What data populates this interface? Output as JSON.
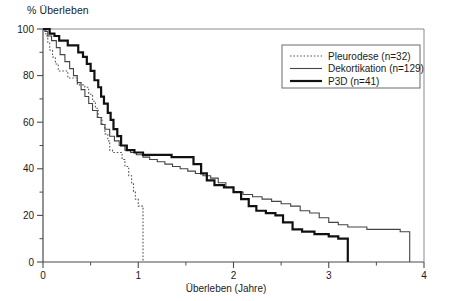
{
  "chart_data": {
    "type": "line",
    "subtype": "kaplan-meier-step",
    "title": "",
    "ylabel": "% Überleben",
    "xlabel": "Überleben (Jahre)",
    "xlim": [
      0,
      4
    ],
    "ylim": [
      0,
      100
    ],
    "xticks": [
      0,
      1,
      2,
      3,
      4
    ],
    "xticklabels": [
      "0",
      "1",
      "2",
      "3",
      "4"
    ],
    "xminorticks": [
      0.5,
      1.5,
      2.5,
      3.5
    ],
    "yticks": [
      0,
      20,
      40,
      60,
      80,
      100
    ],
    "yticklabels": [
      "0",
      "20",
      "40",
      "60",
      "80",
      "100"
    ],
    "yminorticks": [
      10,
      30,
      50,
      70,
      90
    ],
    "grid": false,
    "legend_position": "top-right",
    "series": [
      {
        "name": "Pleurodese (n=32)",
        "label": "Pleurodese (n=32)",
        "n": 32,
        "style": "dotted",
        "color": "#555555",
        "width": 1.1,
        "points": [
          [
            0.0,
            100
          ],
          [
            0.03,
            97
          ],
          [
            0.05,
            94
          ],
          [
            0.07,
            91
          ],
          [
            0.1,
            88
          ],
          [
            0.13,
            85
          ],
          [
            0.16,
            82
          ],
          [
            0.22,
            82
          ],
          [
            0.26,
            79
          ],
          [
            0.32,
            79
          ],
          [
            0.36,
            76
          ],
          [
            0.44,
            75
          ],
          [
            0.48,
            72
          ],
          [
            0.52,
            69
          ],
          [
            0.55,
            66
          ],
          [
            0.58,
            62
          ],
          [
            0.62,
            59
          ],
          [
            0.65,
            55
          ],
          [
            0.68,
            52
          ],
          [
            0.7,
            48
          ],
          [
            0.73,
            47
          ],
          [
            0.8,
            47
          ],
          [
            0.83,
            44
          ],
          [
            0.86,
            41
          ],
          [
            0.9,
            37
          ],
          [
            0.93,
            34
          ],
          [
            0.95,
            30
          ],
          [
            0.97,
            27
          ],
          [
            1.0,
            24
          ],
          [
            1.03,
            24
          ],
          [
            1.05,
            0
          ]
        ]
      },
      {
        "name": "Dekortikation (n=129)",
        "label": "Dekortikation (n=129)",
        "n": 129,
        "style": "solid",
        "color": "#444444",
        "width": 1.1,
        "points": [
          [
            0.0,
            100
          ],
          [
            0.02,
            99
          ],
          [
            0.05,
            97
          ],
          [
            0.09,
            95
          ],
          [
            0.14,
            92
          ],
          [
            0.18,
            89
          ],
          [
            0.23,
            86
          ],
          [
            0.28,
            83
          ],
          [
            0.32,
            80
          ],
          [
            0.36,
            77
          ],
          [
            0.4,
            74
          ],
          [
            0.44,
            71
          ],
          [
            0.48,
            68
          ],
          [
            0.52,
            65
          ],
          [
            0.57,
            62
          ],
          [
            0.61,
            59
          ],
          [
            0.65,
            57
          ],
          [
            0.7,
            54
          ],
          [
            0.75,
            52
          ],
          [
            0.8,
            50
          ],
          [
            0.86,
            48
          ],
          [
            0.92,
            47
          ],
          [
            0.98,
            46
          ],
          [
            1.05,
            45
          ],
          [
            1.12,
            44
          ],
          [
            1.2,
            43
          ],
          [
            1.28,
            42
          ],
          [
            1.36,
            41
          ],
          [
            1.44,
            40
          ],
          [
            1.52,
            39
          ],
          [
            1.6,
            38
          ],
          [
            1.68,
            37
          ],
          [
            1.76,
            36
          ],
          [
            1.84,
            34
          ],
          [
            1.92,
            32
          ],
          [
            2.0,
            30
          ],
          [
            2.1,
            29
          ],
          [
            2.2,
            28
          ],
          [
            2.3,
            27
          ],
          [
            2.4,
            26
          ],
          [
            2.5,
            25
          ],
          [
            2.6,
            24
          ],
          [
            2.7,
            22
          ],
          [
            2.8,
            21
          ],
          [
            2.9,
            19
          ],
          [
            3.0,
            17
          ],
          [
            3.1,
            16
          ],
          [
            3.2,
            15
          ],
          [
            3.4,
            14
          ],
          [
            3.6,
            14
          ],
          [
            3.75,
            13
          ],
          [
            3.85,
            12
          ],
          [
            3.85,
            0
          ]
        ]
      },
      {
        "name": "P3D (n=41)",
        "label": "P3D (n=41)",
        "n": 41,
        "style": "solid",
        "color": "#111111",
        "width": 2.2,
        "points": [
          [
            0.0,
            100
          ],
          [
            0.04,
            100
          ],
          [
            0.07,
            98
          ],
          [
            0.12,
            97
          ],
          [
            0.17,
            95
          ],
          [
            0.22,
            95
          ],
          [
            0.26,
            93
          ],
          [
            0.33,
            93
          ],
          [
            0.37,
            90
          ],
          [
            0.42,
            88
          ],
          [
            0.46,
            85
          ],
          [
            0.5,
            82
          ],
          [
            0.54,
            78
          ],
          [
            0.58,
            75
          ],
          [
            0.61,
            71
          ],
          [
            0.64,
            68
          ],
          [
            0.68,
            64
          ],
          [
            0.71,
            61
          ],
          [
            0.74,
            57
          ],
          [
            0.78,
            54
          ],
          [
            0.82,
            50
          ],
          [
            0.88,
            48
          ],
          [
            0.96,
            47
          ],
          [
            1.05,
            46
          ],
          [
            1.2,
            46
          ],
          [
            1.35,
            45
          ],
          [
            1.5,
            45
          ],
          [
            1.58,
            42
          ],
          [
            1.66,
            38
          ],
          [
            1.72,
            35
          ],
          [
            1.8,
            33
          ],
          [
            1.9,
            32
          ],
          [
            2.0,
            30
          ],
          [
            2.08,
            27
          ],
          [
            2.16,
            24
          ],
          [
            2.24,
            22
          ],
          [
            2.34,
            21
          ],
          [
            2.44,
            20
          ],
          [
            2.52,
            17
          ],
          [
            2.62,
            14
          ],
          [
            2.72,
            13
          ],
          [
            2.85,
            12
          ],
          [
            3.0,
            11
          ],
          [
            3.1,
            10
          ],
          [
            3.2,
            10
          ],
          [
            3.2,
            0
          ]
        ]
      }
    ]
  },
  "legend": {
    "entries": [
      {
        "label": "Pleurodese (n=32)"
      },
      {
        "label": "Dekortikation (n=129)"
      },
      {
        "label": "P3D (n=41)"
      }
    ]
  },
  "axes": {
    "y_axis_title": "% Überleben",
    "x_axis_title": "Überleben (Jahre)"
  }
}
